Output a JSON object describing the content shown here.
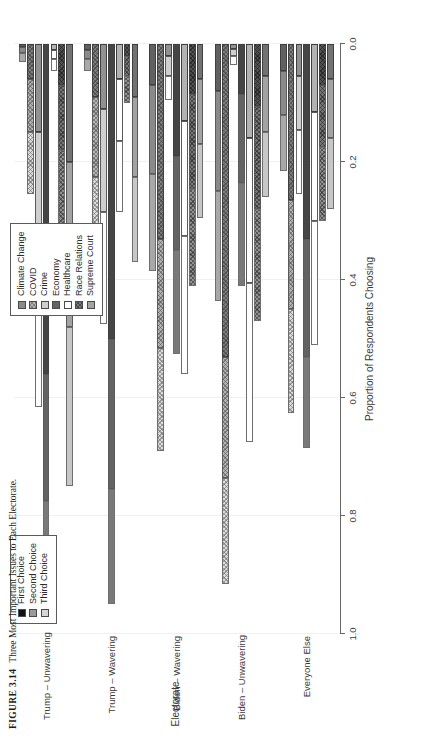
{
  "figure": {
    "number": "FIGURE 3.14",
    "caption": "Three Most Important Issues to Each Electorate."
  },
  "legend_issues": {
    "items": [
      {
        "label": "Climate Change",
        "swatch": "climate-swatch",
        "color": "#8a8a8a"
      },
      {
        "label": "COVID",
        "swatch": "covid-swatch",
        "color": "#b5b5b5"
      },
      {
        "label": "Crime",
        "swatch": "crime-swatch",
        "color": "#cfcfcf"
      },
      {
        "label": "Economy",
        "swatch": "economy-swatch",
        "color": "#636363"
      },
      {
        "label": "Healthcare",
        "swatch": "healthcare-swatch",
        "color": "#ffffff"
      },
      {
        "label": "Race Relations",
        "swatch": "race-swatch",
        "color": "#777777"
      },
      {
        "label": "Supreme Court",
        "swatch": "court-swatch",
        "color": "#a3a3a3"
      }
    ]
  },
  "legend_choice": {
    "items": [
      {
        "label": "First Choice",
        "swatch": "first-choice-swatch",
        "color": "#121212"
      },
      {
        "label": "Second Choice",
        "swatch": "second-choice-swatch",
        "color": "#9a9a9a"
      },
      {
        "label": "Third Choice",
        "swatch": "third-choice-swatch",
        "color": "#d6d6d6"
      }
    ]
  },
  "chart_data": {
    "type": "bar",
    "orientation": "horizontal-stacked-grouped",
    "title": "",
    "xlabel": "Electorate",
    "ylabel": "Proportion of Respondents Choosing",
    "ylim": [
      0.0,
      1.0
    ],
    "yticks": [
      "0.0",
      "0.2",
      "0.4",
      "0.6",
      "0.8",
      "1.0"
    ],
    "ytick_values": [
      0.0,
      0.2,
      0.4,
      0.6,
      0.8,
      1.0
    ],
    "grid": true,
    "legend_position": "top-right and top-left",
    "stack_order": [
      "First Choice",
      "Second Choice",
      "Third Choice"
    ],
    "categories": [
      "Trump – Unwavering",
      "Trump – Wavering",
      "Biden – Wavering",
      "Biden – Unwavering",
      "Everyone Else"
    ],
    "issues": [
      "Climate Change",
      "COVID",
      "Crime",
      "Economy",
      "Healthcare",
      "Race Relations",
      "Supreme Court"
    ],
    "groups": [
      {
        "category": "Trump – Unwavering",
        "bars": [
          {
            "issue": "Climate Change",
            "first": 0.005,
            "second": 0.01,
            "third": 0.015,
            "total": 0.03
          },
          {
            "issue": "COVID",
            "first": 0.06,
            "second": 0.09,
            "third": 0.105,
            "total": 0.255
          },
          {
            "issue": "Crime",
            "first": 0.15,
            "second": 0.2,
            "third": 0.265,
            "total": 0.615
          },
          {
            "issue": "Economy",
            "first": 0.56,
            "second": 0.215,
            "third": 0.175,
            "total": 0.95
          },
          {
            "issue": "Healthcare",
            "first": 0.01,
            "second": 0.015,
            "third": 0.02,
            "total": 0.045
          },
          {
            "issue": "Race Relations",
            "first": 0.07,
            "second": 0.11,
            "third": 0.145,
            "total": 0.325
          },
          {
            "issue": "Supreme Court",
            "first": 0.2,
            "second": 0.28,
            "third": 0.27,
            "total": 0.75
          }
        ]
      },
      {
        "category": "Trump – Wavering",
        "bars": [
          {
            "issue": "Climate Change",
            "first": 0.01,
            "second": 0.015,
            "third": 0.02,
            "total": 0.045
          },
          {
            "issue": "COVID",
            "first": 0.09,
            "second": 0.135,
            "third": 0.21,
            "total": 0.435
          },
          {
            "issue": "Crime",
            "first": 0.11,
            "second": 0.175,
            "third": 0.19,
            "total": 0.475
          },
          {
            "issue": "Economy",
            "first": 0.5,
            "second": 0.255,
            "third": 0.195,
            "total": 0.95
          },
          {
            "issue": "Healthcare",
            "first": 0.06,
            "second": 0.105,
            "third": 0.12,
            "total": 0.285
          },
          {
            "issue": "Race Relations",
            "first": 0.02,
            "second": 0.035,
            "third": 0.045,
            "total": 0.1
          },
          {
            "issue": "Supreme Court",
            "first": 0.09,
            "second": 0.135,
            "third": 0.145,
            "total": 0.37
          }
        ]
      },
      {
        "category": "Biden – Wavering",
        "bars": [
          {
            "issue": "Climate Change",
            "first": 0.07,
            "second": 0.15,
            "third": 0.165,
            "total": 0.385
          },
          {
            "issue": "COVID",
            "first": 0.33,
            "second": 0.185,
            "third": 0.175,
            "total": 0.69
          },
          {
            "issue": "Crime",
            "first": 0.02,
            "second": 0.035,
            "third": 0.04,
            "total": 0.095
          },
          {
            "issue": "Economy",
            "first": 0.19,
            "second": 0.16,
            "third": 0.175,
            "total": 0.525
          },
          {
            "issue": "Healthcare",
            "first": 0.13,
            "second": 0.195,
            "third": 0.235,
            "total": 0.56
          },
          {
            "issue": "Race Relations",
            "first": 0.085,
            "second": 0.16,
            "third": 0.165,
            "total": 0.41
          },
          {
            "issue": "Supreme Court",
            "first": 0.06,
            "second": 0.11,
            "third": 0.125,
            "total": 0.295
          }
        ]
      },
      {
        "category": "Biden – Unwavering",
        "bars": [
          {
            "issue": "Climate Change",
            "first": 0.08,
            "second": 0.17,
            "third": 0.185,
            "total": 0.435
          },
          {
            "issue": "COVID",
            "first": 0.53,
            "second": 0.205,
            "third": 0.18,
            "total": 0.915
          },
          {
            "issue": "Crime",
            "first": 0.008,
            "second": 0.012,
            "third": 0.015,
            "total": 0.035
          },
          {
            "issue": "Economy",
            "first": 0.085,
            "second": 0.15,
            "third": 0.175,
            "total": 0.41
          },
          {
            "issue": "Healthcare",
            "first": 0.16,
            "second": 0.245,
            "third": 0.27,
            "total": 0.675
          },
          {
            "issue": "Race Relations",
            "first": 0.105,
            "second": 0.175,
            "third": 0.19,
            "total": 0.47
          },
          {
            "issue": "Supreme Court",
            "first": 0.055,
            "second": 0.095,
            "third": 0.11,
            "total": 0.26
          }
        ]
      },
      {
        "category": "Everyone Else",
        "bars": [
          {
            "issue": "Climate Change",
            "first": 0.045,
            "second": 0.075,
            "third": 0.095,
            "total": 0.215
          },
          {
            "issue": "COVID",
            "first": 0.265,
            "second": 0.185,
            "third": 0.175,
            "total": 0.625
          },
          {
            "issue": "Crime",
            "first": 0.055,
            "second": 0.09,
            "third": 0.11,
            "total": 0.255
          },
          {
            "issue": "Economy",
            "first": 0.33,
            "second": 0.2,
            "third": 0.155,
            "total": 0.685
          },
          {
            "issue": "Healthcare",
            "first": 0.115,
            "second": 0.185,
            "third": 0.21,
            "total": 0.51
          },
          {
            "issue": "Race Relations",
            "first": 0.07,
            "second": 0.105,
            "third": 0.125,
            "total": 0.3
          },
          {
            "issue": "Supreme Court",
            "first": 0.06,
            "second": 0.1,
            "third": 0.12,
            "total": 0.28
          }
        ]
      }
    ]
  }
}
